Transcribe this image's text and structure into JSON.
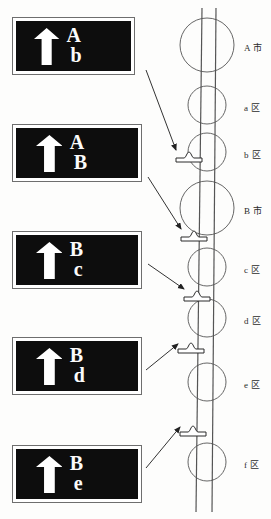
{
  "figure": {
    "colors": {
      "sign_background": "#0d0d0d",
      "sign_text": "#ffffff",
      "sign_border": "#6e6e6e",
      "line": "#555555",
      "page_background": "#fdfdfc"
    }
  },
  "signboards": [
    {
      "id": "sign-1",
      "arrow": "up-arrow-icon",
      "line1": "A",
      "line2": "b",
      "x": 12,
      "y": 17,
      "w": 123,
      "h": 58
    },
    {
      "id": "sign-2",
      "arrow": "up-arrow-icon",
      "line1": "A",
      "line2": "B",
      "x": 12,
      "y": 124,
      "w": 130,
      "h": 58
    },
    {
      "id": "sign-3",
      "arrow": "up-arrow-icon",
      "line1": "B",
      "line2": "c",
      "x": 12,
      "y": 231,
      "w": 130,
      "h": 58
    },
    {
      "id": "sign-4",
      "arrow": "up-arrow-icon",
      "line1": "B",
      "line2": "d",
      "x": 12,
      "y": 337,
      "w": 130,
      "h": 58
    },
    {
      "id": "sign-5",
      "arrow": "up-arrow-icon",
      "line1": "B",
      "line2": "e",
      "x": 12,
      "y": 445,
      "w": 130,
      "h": 58
    }
  ],
  "map": {
    "road_label": "two-lane-road",
    "nodes": [
      {
        "id": "node-a-shi",
        "label": "A 市",
        "cy": 45,
        "r": 27,
        "label_x": 246,
        "label_y": 41
      },
      {
        "id": "node-a-qu",
        "label": "a 区",
        "cy": 105,
        "r": 19,
        "label_x": 246,
        "label_y": 101
      },
      {
        "id": "node-b-qu",
        "label": "b 区",
        "cy": 152,
        "r": 19,
        "label_x": 246,
        "label_y": 148
      },
      {
        "id": "node-b-shi",
        "label": "B 市",
        "cy": 208,
        "r": 27,
        "label_x": 246,
        "label_y": 204
      },
      {
        "id": "node-c-qu",
        "label": "c 区",
        "cy": 267,
        "r": 19,
        "label_x": 246,
        "label_y": 263
      },
      {
        "id": "node-d-qu",
        "label": "d 区",
        "cy": 318,
        "r": 19,
        "label_x": 246,
        "label_y": 314
      },
      {
        "id": "node-e-qu",
        "label": "e 区",
        "cy": 382,
        "r": 19,
        "label_x": 246,
        "label_y": 378
      },
      {
        "id": "node-f-qu",
        "label": "f 区",
        "cy": 462,
        "r": 19,
        "label_x": 246,
        "label_y": 458
      }
    ],
    "markers": [
      {
        "id": "marker-1",
        "x": 176,
        "y": 157
      },
      {
        "id": "marker-2",
        "x": 181,
        "y": 236
      },
      {
        "id": "marker-3",
        "x": 184,
        "y": 296
      },
      {
        "id": "marker-4",
        "x": 178,
        "y": 348
      },
      {
        "id": "marker-5",
        "x": 180,
        "y": 431
      }
    ],
    "leaders": [
      {
        "id": "leader-1",
        "x1": 146,
        "y1": 70,
        "x2": 177,
        "y2": 151
      },
      {
        "id": "leader-2",
        "x1": 148,
        "y1": 177,
        "x2": 182,
        "y2": 230
      },
      {
        "id": "leader-3",
        "x1": 148,
        "y1": 264,
        "x2": 185,
        "y2": 290
      },
      {
        "id": "leader-4",
        "x1": 146,
        "y1": 370,
        "x2": 179,
        "y2": 344
      },
      {
        "id": "leader-5",
        "x1": 146,
        "y1": 468,
        "x2": 181,
        "y2": 427
      }
    ]
  }
}
